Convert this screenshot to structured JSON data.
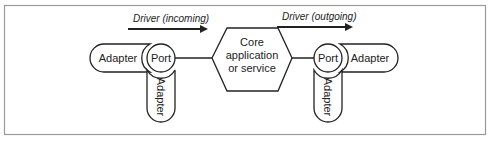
{
  "diagram": {
    "core": {
      "lines": [
        "Core",
        "application",
        "or service"
      ]
    },
    "drivers": {
      "incoming": "Driver (incoming)",
      "outgoing": "Driver (outgoing)"
    },
    "left": {
      "port": "Port",
      "adapter_side": "Adapter",
      "adapter_bottom": "Adapter"
    },
    "right": {
      "port": "Port",
      "adapter_side": "Adapter",
      "adapter_bottom": "Adapter"
    },
    "colors": {
      "stroke": "#222222",
      "frame": "#9a9a9a",
      "background": "#ffffff"
    }
  }
}
